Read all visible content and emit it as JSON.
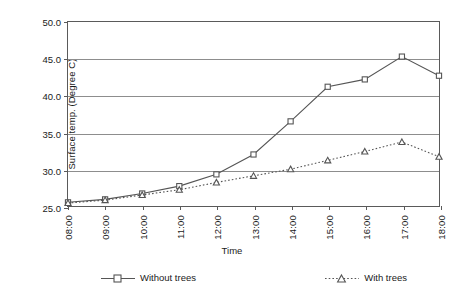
{
  "chart_data": {
    "type": "line",
    "title": "",
    "xlabel": "Time",
    "ylabel": "Surface temp. (Degree C)",
    "categories": [
      "08:00",
      "09:00",
      "10:00",
      "11:00",
      "12:00",
      "13:00",
      "14:00",
      "15:00",
      "16:00",
      "17:00",
      "18:00"
    ],
    "ylim": [
      25.0,
      50.0
    ],
    "ytick_labels": [
      "50.0",
      "45.0",
      "40.0",
      "35.0",
      "30.0",
      "25.0"
    ],
    "ytick_values": [
      50.0,
      45.0,
      40.0,
      35.0,
      30.0,
      25.0
    ],
    "grid": "horizontal",
    "legend_position": "bottom",
    "series": [
      {
        "name": "Without trees",
        "marker": "square",
        "line_style": "solid",
        "color": "#555555",
        "values": [
          25.5,
          25.9,
          26.7,
          27.7,
          29.3,
          32.0,
          36.5,
          41.2,
          42.2,
          45.3,
          42.7
        ]
      },
      {
        "name": "With trees",
        "marker": "triangle",
        "line_style": "dotted",
        "color": "#555555",
        "values": [
          25.4,
          25.8,
          26.5,
          27.2,
          28.2,
          29.1,
          30.0,
          31.2,
          32.4,
          33.7,
          31.7
        ]
      }
    ]
  },
  "legend": {
    "entries": [
      {
        "label": "Without trees"
      },
      {
        "label": "With trees"
      }
    ]
  },
  "axes": {
    "x_title": "Time",
    "y_title": "Surface temp. (Degree C)"
  },
  "colors": {
    "plot_border": "#5a5a5a",
    "gridline": "#8d8d8d",
    "series_line": "#555555",
    "background": "#ffffff",
    "text": "#1a1a1a"
  }
}
